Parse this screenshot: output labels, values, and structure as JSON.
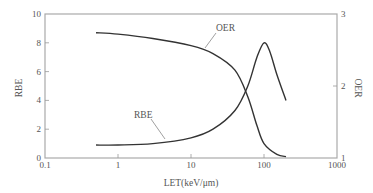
{
  "chart_data": {
    "type": "line",
    "title": "",
    "xlabel": "LET(keV/μm)",
    "ylabel": "RBE",
    "y2label": "OER",
    "x_scale": "log",
    "xlim": [
      0.1,
      1000
    ],
    "ylim": [
      0,
      10
    ],
    "y2lim": [
      1,
      3
    ],
    "x_ticks": [
      "0.1",
      "1",
      "10",
      "100",
      "1000"
    ],
    "y_ticks": [
      "0",
      "2",
      "4",
      "6",
      "8",
      "10"
    ],
    "y2_ticks": [
      "1",
      "2",
      "3"
    ],
    "grid": false,
    "legend": "inline annotations",
    "series": [
      {
        "name": "RBE",
        "axis": "left",
        "x": [
          0.5,
          1,
          3,
          10,
          20,
          40,
          60,
          80,
          100,
          120,
          150,
          200
        ],
        "y": [
          0.9,
          0.9,
          1.0,
          1.4,
          2.0,
          3.3,
          5.0,
          7.0,
          8.0,
          7.4,
          5.8,
          4.0
        ]
      },
      {
        "name": "OER",
        "axis": "right",
        "x": [
          0.5,
          1,
          3,
          10,
          20,
          40,
          60,
          80,
          100,
          150,
          200
        ],
        "y": [
          2.74,
          2.72,
          2.66,
          2.56,
          2.45,
          2.22,
          1.85,
          1.45,
          1.2,
          1.05,
          1.02
        ]
      }
    ],
    "annotations": [
      {
        "text": "OER",
        "target": "OER curve"
      },
      {
        "text": "RBE",
        "target": "RBE curve"
      }
    ]
  },
  "labels": {
    "xlabel": "LET(keV/μm)",
    "ylabel": "RBE",
    "y2label": "OER",
    "oer_annotation": "OER",
    "rbe_annotation": "RBE",
    "x_ticks": [
      "0.1",
      "1",
      "10",
      "100",
      "1000"
    ],
    "y_ticks": [
      "0",
      "2",
      "4",
      "6",
      "8",
      "10"
    ],
    "y2_ticks": [
      "1",
      "2",
      "3"
    ]
  }
}
